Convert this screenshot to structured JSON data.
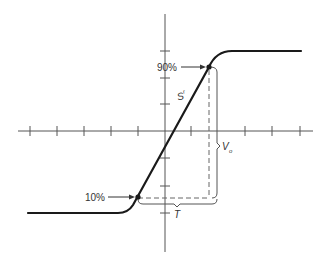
{
  "diagram": {
    "type": "step-response-slew-rate",
    "colors": {
      "axis": "#555555",
      "curve": "#1a1a1a",
      "dashed": "#666666",
      "background": "#ffffff"
    },
    "axes": {
      "horizontal_ticks": 10,
      "vertical_ticks": 6
    },
    "labels": {
      "point_90": "90%",
      "point_10": "10%",
      "slope_main": "S",
      "slope_sub": "r",
      "amplitude_main": "V",
      "amplitude_sub": "o",
      "time": "T"
    }
  }
}
